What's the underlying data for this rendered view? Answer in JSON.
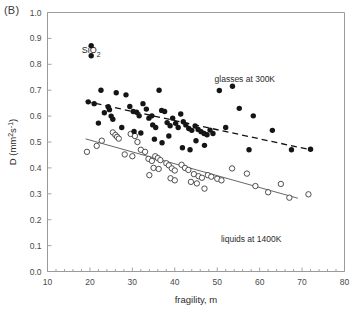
{
  "panel": {
    "label": "(B)"
  },
  "chart_data": {
    "type": "scatter",
    "title": "",
    "panel_label": "(B)",
    "xlabel": "fragility, m",
    "ylabel": "D (mm²s⁻¹)",
    "ylabel_parts": {
      "base": "D (mm",
      "sup1": "2",
      "mid": "s",
      "sup2": "-1",
      "tail": ")"
    },
    "xlim": [
      10,
      80
    ],
    "ylim": [
      0.0,
      1.0
    ],
    "xticks": [
      10,
      20,
      30,
      40,
      50,
      60,
      70,
      80
    ],
    "xticklabels": [
      "10",
      "20",
      "30",
      "40",
      "50",
      "60",
      "70",
      "80"
    ],
    "yticks": [
      0.0,
      0.1,
      0.2,
      0.3,
      0.4,
      0.5,
      0.6,
      0.7,
      0.8,
      0.9,
      1.0
    ],
    "yticklabels": [
      "0.0",
      "0.1",
      "0.2",
      "0.3",
      "0.4",
      "0.5",
      "0.6",
      "0.7",
      "0.8",
      "0.9",
      "1.0"
    ],
    "grid": false,
    "legend_position": "none",
    "annotations": [
      {
        "text": "SiO2",
        "display": "SiO₂",
        "x": 22.5,
        "y": 0.855
      },
      {
        "text": "glasses at 300K",
        "x": 56.5,
        "y": 0.745
      },
      {
        "text": "liquids at 1400K",
        "x": 58.0,
        "y": 0.125
      }
    ],
    "series": [
      {
        "name": "glasses at 300K",
        "marker": "filled-circle",
        "color": "#151515",
        "points": [
          [
            20.3,
            0.872
          ],
          [
            20.3,
            0.833
          ],
          [
            19.6,
            0.655
          ],
          [
            21.0,
            0.648
          ],
          [
            22.6,
            0.7
          ],
          [
            23.4,
            0.613
          ],
          [
            24.3,
            0.636
          ],
          [
            24.6,
            0.625
          ],
          [
            25.0,
            0.6
          ],
          [
            25.4,
            0.588
          ],
          [
            22.0,
            0.573
          ],
          [
            26.2,
            0.69
          ],
          [
            28.5,
            0.682
          ],
          [
            27.5,
            0.556
          ],
          [
            29.4,
            0.637
          ],
          [
            30.2,
            0.618
          ],
          [
            31.0,
            0.615
          ],
          [
            31.6,
            0.601
          ],
          [
            32.5,
            0.648
          ],
          [
            33.3,
            0.627
          ],
          [
            33.9,
            0.592
          ],
          [
            34.6,
            0.601
          ],
          [
            30.4,
            0.541
          ],
          [
            32.0,
            0.535
          ],
          [
            34.8,
            0.566
          ],
          [
            35.5,
            0.556
          ],
          [
            36.3,
            0.7
          ],
          [
            36.9,
            0.622
          ],
          [
            37.6,
            0.618
          ],
          [
            38.2,
            0.575
          ],
          [
            38.9,
            0.563
          ],
          [
            39.5,
            0.592
          ],
          [
            40.2,
            0.572
          ],
          [
            40.8,
            0.556
          ],
          [
            35.2,
            0.511
          ],
          [
            37.0,
            0.497
          ],
          [
            38.6,
            0.523
          ],
          [
            41.4,
            0.608
          ],
          [
            42.0,
            0.578
          ],
          [
            42.6,
            0.566
          ],
          [
            43.3,
            0.552
          ],
          [
            44.0,
            0.545
          ],
          [
            44.8,
            0.562
          ],
          [
            45.5,
            0.548
          ],
          [
            46.2,
            0.54
          ],
          [
            46.9,
            0.533
          ],
          [
            41.8,
            0.478
          ],
          [
            43.6,
            0.47
          ],
          [
            45.0,
            0.505
          ],
          [
            47.6,
            0.528
          ],
          [
            48.3,
            0.546
          ],
          [
            49.0,
            0.533
          ],
          [
            47.0,
            0.487
          ],
          [
            50.5,
            0.699
          ],
          [
            53.6,
            0.715
          ],
          [
            52.0,
            0.556
          ],
          [
            55.2,
            0.63
          ],
          [
            57.5,
            0.47
          ],
          [
            58.5,
            0.601
          ],
          [
            63.0,
            0.545
          ],
          [
            67.5,
            0.47
          ],
          [
            72.0,
            0.472
          ]
        ]
      },
      {
        "name": "liquids at 1400K",
        "marker": "open-circle",
        "color": "#3c3c3c",
        "points": [
          [
            19.3,
            0.462
          ],
          [
            21.6,
            0.485
          ],
          [
            22.8,
            0.505
          ],
          [
            25.4,
            0.537
          ],
          [
            26.0,
            0.527
          ],
          [
            26.4,
            0.52
          ],
          [
            26.8,
            0.513
          ],
          [
            29.6,
            0.531
          ],
          [
            30.6,
            0.523
          ],
          [
            31.2,
            0.5
          ],
          [
            28.2,
            0.452
          ],
          [
            30.0,
            0.445
          ],
          [
            32.0,
            0.47
          ],
          [
            33.0,
            0.462
          ],
          [
            33.8,
            0.435
          ],
          [
            34.6,
            0.427
          ],
          [
            35.4,
            0.445
          ],
          [
            36.0,
            0.438
          ],
          [
            36.6,
            0.43
          ],
          [
            35.0,
            0.4
          ],
          [
            36.2,
            0.396
          ],
          [
            34.0,
            0.372
          ],
          [
            38.0,
            0.418
          ],
          [
            38.6,
            0.41
          ],
          [
            39.3,
            0.398
          ],
          [
            40.0,
            0.39
          ],
          [
            39.0,
            0.36
          ],
          [
            40.0,
            0.352
          ],
          [
            41.6,
            0.412
          ],
          [
            42.4,
            0.4
          ],
          [
            43.2,
            0.392
          ],
          [
            44.5,
            0.376
          ],
          [
            45.6,
            0.368
          ],
          [
            46.4,
            0.362
          ],
          [
            43.8,
            0.346
          ],
          [
            45.2,
            0.34
          ],
          [
            47.8,
            0.372
          ],
          [
            48.6,
            0.366
          ],
          [
            50.0,
            0.358
          ],
          [
            51.0,
            0.352
          ],
          [
            47.0,
            0.32
          ],
          [
            53.5,
            0.398
          ],
          [
            57.0,
            0.378
          ],
          [
            59.0,
            0.33
          ],
          [
            62.0,
            0.306
          ],
          [
            65.0,
            0.338
          ],
          [
            67.0,
            0.285
          ],
          [
            71.5,
            0.298
          ]
        ]
      }
    ],
    "fit_lines": [
      {
        "name": "glasses-fit",
        "style": "dashed",
        "color": "#111111",
        "x0": 19.0,
        "y0": 0.657,
        "x1": 72.5,
        "y1": 0.468
      },
      {
        "name": "liquids-fit",
        "style": "solid",
        "color": "#555555",
        "x0": 19.0,
        "y0": 0.512,
        "x1": 69.0,
        "y1": 0.283
      }
    ]
  }
}
